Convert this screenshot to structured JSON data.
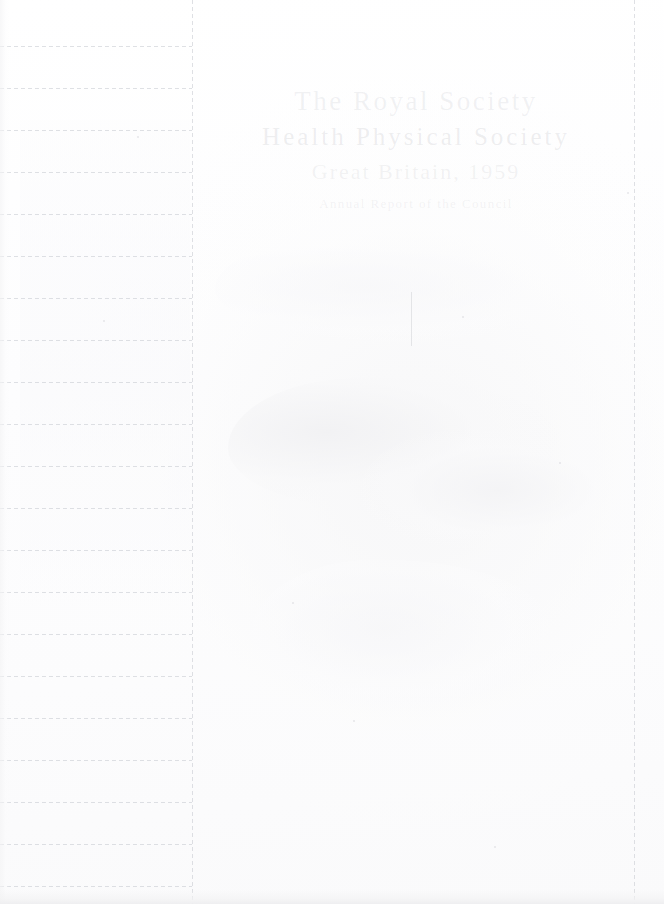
{
  "document": {
    "kind": "scanned-ruled-page",
    "background_color": "#fdfdfd",
    "rule_color": "#c4c7ce",
    "ink_color": "#96989f",
    "width": 664,
    "height": 904
  },
  "ghost_text": {
    "line_1": "The Royal Society",
    "line_2": "Health Physical Society",
    "line_3": "Great Britain, 1959",
    "line_4": "Annual Report of the Council"
  },
  "left_column": {
    "label": "ruled-margin-column",
    "rule_start_y": 46,
    "rule_spacing": 42,
    "rule_count": 21,
    "rule_width": 192
  },
  "vertical_rules": [
    {
      "name": "margin-divider",
      "x": 192
    },
    {
      "name": "right-margin-divider",
      "x": 634
    }
  ],
  "flecks": [
    {
      "x": 137,
      "y": 136
    },
    {
      "x": 103,
      "y": 320
    },
    {
      "x": 462,
      "y": 316
    },
    {
      "x": 559,
      "y": 462
    },
    {
      "x": 353,
      "y": 720
    },
    {
      "x": 627,
      "y": 192
    },
    {
      "x": 494,
      "y": 846
    },
    {
      "x": 292,
      "y": 602
    }
  ]
}
